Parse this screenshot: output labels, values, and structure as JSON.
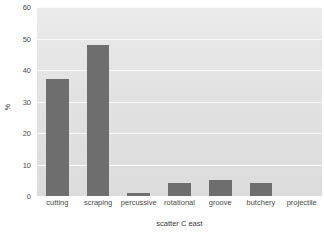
{
  "chart_data": {
    "type": "bar",
    "title": "",
    "xlabel": "scatter C east",
    "ylabel": "%",
    "categories": [
      "cutting",
      "scraping",
      "percussive",
      "rotational",
      "groove",
      "butchery",
      "projectile"
    ],
    "values": [
      37,
      48,
      1,
      4,
      5,
      4,
      0
    ],
    "ylim": [
      0,
      60
    ],
    "yticks": [
      0,
      10,
      20,
      30,
      40,
      50,
      60
    ],
    "ytick_labels": [
      "0",
      "10",
      "20",
      "30",
      "40",
      "50",
      "60"
    ],
    "grid": true,
    "grid_axis": "y",
    "legend": false,
    "legend_position": "none",
    "bar_color": "#6e6e6e",
    "plot_background": "#e3e3e3",
    "figure_background": "#ffffff",
    "gridline_color": "#fbfbfb",
    "tick_label_color": "#4a4a4a"
  }
}
